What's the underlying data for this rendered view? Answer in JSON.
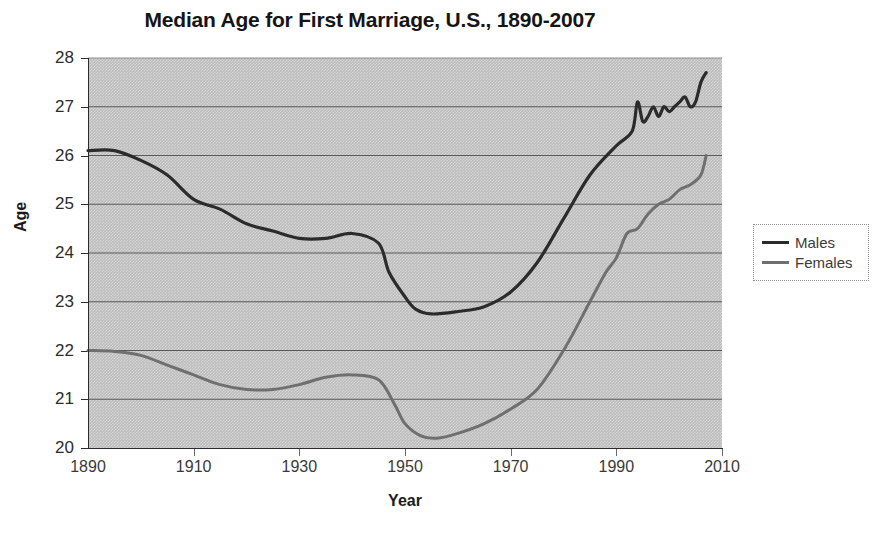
{
  "chart_data": {
    "type": "line",
    "title": "Median Age for First Marriage, U.S., 1890-2007",
    "xlabel": "Year",
    "ylabel": "Age",
    "xlim": [
      1890,
      2010
    ],
    "ylim": [
      20,
      28
    ],
    "xticks": [
      1890,
      1910,
      1930,
      1950,
      1970,
      1990,
      2010
    ],
    "yticks": [
      20,
      21,
      22,
      23,
      24,
      25,
      26,
      27,
      28
    ],
    "grid": "horizontal",
    "legend_position": "right",
    "plot_background": "#bcbcbc",
    "series": [
      {
        "name": "Males",
        "color": "#2b2b2b",
        "x": [
          1890,
          1895,
          1900,
          1905,
          1910,
          1915,
          1920,
          1925,
          1930,
          1935,
          1940,
          1945,
          1947,
          1950,
          1952,
          1955,
          1960,
          1965,
          1970,
          1975,
          1980,
          1985,
          1990,
          1993,
          1994,
          1995,
          1996,
          1997,
          1998,
          1999,
          2000,
          2001,
          2002,
          2003,
          2004,
          2005,
          2006,
          2007
        ],
        "y": [
          26.1,
          26.1,
          25.9,
          25.6,
          25.1,
          24.9,
          24.6,
          24.45,
          24.3,
          24.3,
          24.4,
          24.2,
          23.6,
          23.1,
          22.85,
          22.75,
          22.8,
          22.9,
          23.2,
          23.8,
          24.7,
          25.6,
          26.2,
          26.5,
          27.1,
          26.7,
          26.8,
          27.0,
          26.8,
          27.0,
          26.9,
          27.0,
          27.1,
          27.2,
          27.0,
          27.1,
          27.5,
          27.7
        ]
      },
      {
        "name": "Females",
        "color": "#6f6f6f",
        "x": [
          1890,
          1895,
          1900,
          1905,
          1910,
          1915,
          1920,
          1925,
          1930,
          1935,
          1940,
          1945,
          1948,
          1950,
          1953,
          1956,
          1960,
          1965,
          1970,
          1975,
          1980,
          1985,
          1988,
          1990,
          1992,
          1994,
          1996,
          1998,
          2000,
          2002,
          2004,
          2006,
          2007
        ],
        "y": [
          22.0,
          21.98,
          21.9,
          21.7,
          21.5,
          21.3,
          21.2,
          21.2,
          21.3,
          21.45,
          21.5,
          21.4,
          20.9,
          20.5,
          20.25,
          20.2,
          20.3,
          20.5,
          20.8,
          21.2,
          22.0,
          23.0,
          23.6,
          23.9,
          24.4,
          24.5,
          24.8,
          25.0,
          25.1,
          25.3,
          25.4,
          25.6,
          26.0
        ]
      }
    ]
  },
  "legend": {
    "items": [
      {
        "label": "Males",
        "color": "#2b2b2b"
      },
      {
        "label": "Females",
        "color": "#6f6f6f"
      }
    ]
  }
}
